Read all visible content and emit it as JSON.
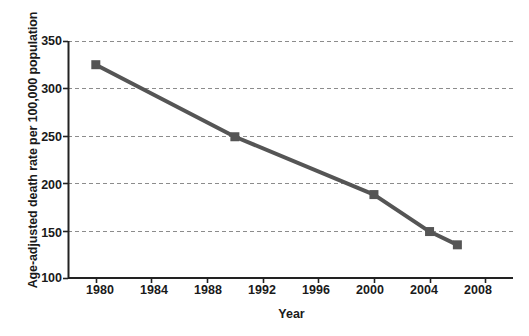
{
  "chart_data": {
    "type": "line",
    "title": "",
    "xlabel": "Year",
    "ylabel": "Age-adjusted death rate per 100,000 population",
    "xlim": [
      1978,
      2010
    ],
    "ylim": [
      100,
      350
    ],
    "xticks": [
      1980,
      1984,
      1988,
      1992,
      1996,
      2000,
      2004,
      2008
    ],
    "xtick_labels": [
      "1980",
      "1984",
      "1988",
      "1992",
      "1996",
      "2000",
      "2004",
      "2008"
    ],
    "yticks": [
      100,
      150,
      200,
      250,
      300,
      350
    ],
    "ytick_labels": [
      "100",
      "150",
      "200",
      "250",
      "300",
      "350"
    ],
    "grid": "horizontal-dashed",
    "legend": "none",
    "series": [
      {
        "name": "Age-adjusted death rate",
        "marker": "square",
        "color": "#555555",
        "x": [
          1980,
          1990,
          2000,
          2004,
          2006
        ],
        "values": [
          325,
          249,
          188,
          149,
          135
        ],
        "points": [
          {
            "x": 1980,
            "y": 325
          },
          {
            "x": 1990,
            "y": 249
          },
          {
            "x": 2000,
            "y": 188
          },
          {
            "x": 2004,
            "y": 149
          },
          {
            "x": 2006,
            "y": 135
          }
        ]
      }
    ]
  },
  "colors": {
    "line": "#555555",
    "marker": "#555555",
    "axis": "#222222",
    "grid": "#8c8c8c",
    "background": "#ffffff",
    "text": "#1a1a1a"
  }
}
